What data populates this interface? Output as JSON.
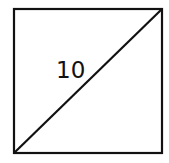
{
  "diagram": {
    "type": "square-with-diagonal",
    "stroke_color": "#111111",
    "background_color": "#ffffff",
    "label": "10",
    "square": {
      "x": 14,
      "y": 9,
      "width": 148,
      "height": 144
    },
    "diagonal": {
      "from": "bottom-left",
      "to": "top-right"
    }
  }
}
